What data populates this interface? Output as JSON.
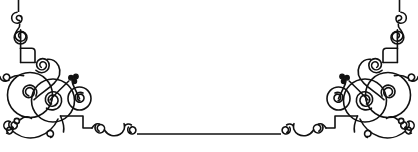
{
  "artwork": {
    "title": "Ornamental Corner Border",
    "kind": "decorative-flourish-border",
    "style": "victorian-calligraphic-filigree",
    "ink_color": "#111111",
    "background_color": "#ffffff",
    "canvas": {
      "width": 418,
      "height": 152
    },
    "symmetry": "horizontal-mirror",
    "stroke_width": 1.6
  },
  "elements": {
    "left_corner_label": "Left corner flourish",
    "right_corner_label": "Right corner flourish",
    "baseline_label": "Horizontal divider rule",
    "left_riser_label": "Left vertical rule",
    "right_riser_label": "Right vertical rule"
  },
  "geometry": {
    "baseline": {
      "y": 134,
      "x_start": 137,
      "x_end": 281
    },
    "left_riser": {
      "x": 18.5,
      "y_top": 0,
      "y_bottom": 12
    },
    "right_riser": {
      "x": 399.5,
      "y_top": 0,
      "y_bottom": 12
    }
  }
}
